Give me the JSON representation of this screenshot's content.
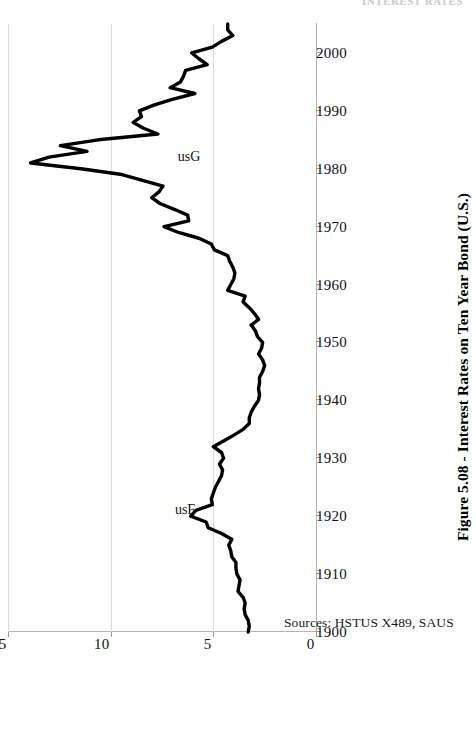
{
  "page": {
    "header_partial": "INTEREST RATES"
  },
  "figure": {
    "caption": "Figure 5.08 - Interest Rates on Ten Year Bond (U.S.)",
    "source_note": "Sources: HSTUS X489, SAUS",
    "orientation": "rotated-90-ccw"
  },
  "chart_data": {
    "type": "line",
    "title": "Figure 5.08 - Interest Rates on Ten Year Bond (U.S.)",
    "xlabel": "",
    "ylabel": "",
    "xlim": [
      1900,
      2005
    ],
    "ylim": [
      0,
      15
    ],
    "grid": true,
    "legend_position": "inline-annotation",
    "x_ticks": [
      1900,
      1910,
      1920,
      1930,
      1940,
      1950,
      1960,
      1970,
      1980,
      1990,
      2000
    ],
    "y_ticks": [
      0,
      5,
      10,
      15
    ],
    "annotations": [
      {
        "text": "usF",
        "x": 1921,
        "y": 6.4
      },
      {
        "text": "usG",
        "x": 1982,
        "y": 6.2
      }
    ],
    "series": [
      {
        "name": "usF",
        "color": "#000000",
        "x": [
          1900,
          1901,
          1902,
          1903,
          1904,
          1905,
          1906,
          1907,
          1908,
          1909,
          1910,
          1911,
          1912,
          1913,
          1914,
          1915,
          1916,
          1917,
          1918,
          1919,
          1920,
          1921,
          1922,
          1923,
          1924,
          1925,
          1926,
          1927,
          1928,
          1929,
          1930,
          1931,
          1932,
          1933,
          1934,
          1935,
          1936,
          1937,
          1938,
          1939,
          1940,
          1941,
          1942,
          1943,
          1944,
          1945,
          1946,
          1947,
          1948,
          1949,
          1950,
          1951,
          1952,
          1953
        ],
        "values": [
          3.3,
          3.25,
          3.3,
          3.45,
          3.5,
          3.45,
          3.55,
          3.8,
          3.75,
          3.7,
          3.85,
          3.9,
          3.9,
          4.1,
          4.15,
          4.25,
          4.1,
          4.6,
          5.25,
          5.35,
          6.1,
          5.85,
          5.05,
          5.1,
          5.0,
          4.9,
          4.75,
          4.6,
          4.55,
          4.7,
          4.5,
          4.6,
          5.0,
          4.5,
          4.0,
          3.55,
          3.25,
          3.25,
          3.15,
          3.0,
          2.8,
          2.75,
          2.8,
          2.75,
          2.75,
          2.6,
          2.5,
          2.6,
          2.8,
          2.65,
          2.6,
          2.85,
          2.95,
          3.15
        ]
      },
      {
        "name": "usG",
        "color": "#000000",
        "x": [
          1953,
          1954,
          1955,
          1956,
          1957,
          1958,
          1959,
          1960,
          1961,
          1962,
          1963,
          1964,
          1965,
          1966,
          1967,
          1968,
          1969,
          1970,
          1971,
          1972,
          1973,
          1974,
          1975,
          1976,
          1977,
          1978,
          1979,
          1980,
          1981,
          1982,
          1983,
          1984,
          1985,
          1986,
          1987,
          1988,
          1989,
          1990,
          1991,
          1992,
          1993,
          1994,
          1995,
          1996,
          1997,
          1998,
          1999,
          2000,
          2001,
          2002,
          2003,
          2004,
          2005
        ],
        "values": [
          3.15,
          2.8,
          3.0,
          3.25,
          3.55,
          3.45,
          4.3,
          4.15,
          4.0,
          3.95,
          4.05,
          4.2,
          4.3,
          4.95,
          5.1,
          5.7,
          6.7,
          7.4,
          6.2,
          6.25,
          6.9,
          7.6,
          8.0,
          7.65,
          7.45,
          8.45,
          9.45,
          11.45,
          13.9,
          13.0,
          11.15,
          12.45,
          10.6,
          7.7,
          8.4,
          8.9,
          8.5,
          8.6,
          7.9,
          7.0,
          5.9,
          7.1,
          6.6,
          6.45,
          6.35,
          5.3,
          5.7,
          6.05,
          5.05,
          4.6,
          4.05,
          4.3,
          4.3
        ]
      }
    ]
  }
}
